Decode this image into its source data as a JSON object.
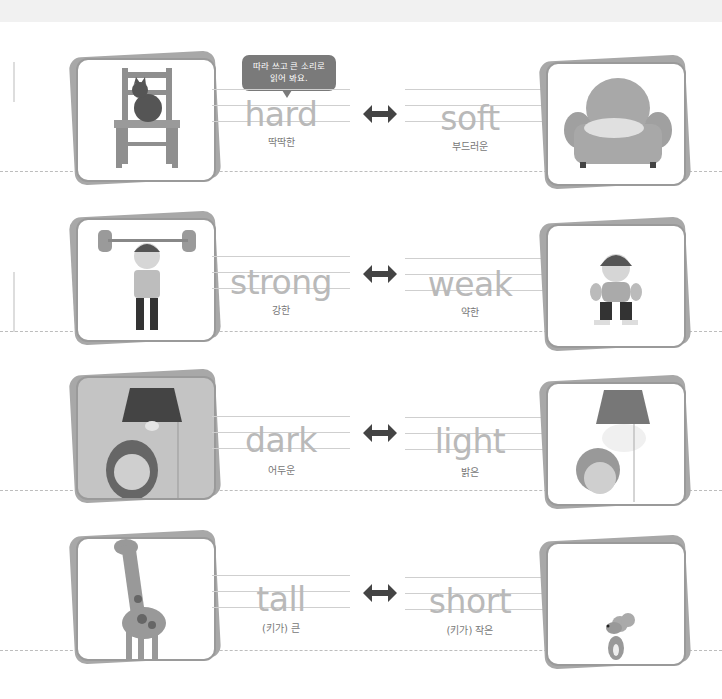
{
  "header": {
    "cut_title": "ㆍㆍㆍㆍㆍ"
  },
  "instruction_bubble": {
    "line1": "따라 쓰고 큰 소리로",
    "line2": "읽어 봐요."
  },
  "arrow_icon": "left-right-arrow",
  "pairs": [
    {
      "left": {
        "word": "hard",
        "meaning": "딱딱한",
        "image": "chair-with-cat"
      },
      "right": {
        "word": "soft",
        "meaning": "부드러운",
        "image": "armchair-with-sleeping-cat"
      }
    },
    {
      "left": {
        "word": "strong",
        "meaning": "강한",
        "image": "boy-lifting-heavy-barbell"
      },
      "right": {
        "word": "weak",
        "meaning": "약한",
        "image": "boy-squatting-with-small-barbell"
      }
    },
    {
      "left": {
        "word": "dark",
        "meaning": "어두운",
        "image": "girl-under-unlit-lamp"
      },
      "right": {
        "word": "light",
        "meaning": "밝은",
        "image": "woman-under-lit-lamp"
      }
    },
    {
      "left": {
        "word": "tall",
        "meaning": "(키가) 큰",
        "image": "giraffe"
      },
      "right": {
        "word": "short",
        "meaning": "(키가) 작은",
        "image": "mouse"
      }
    }
  ],
  "colors": {
    "word_trace": "#b9b9b9",
    "arrow": "#444444",
    "bubble": "#7a7a7a",
    "card_border": "#9a9a9a"
  }
}
